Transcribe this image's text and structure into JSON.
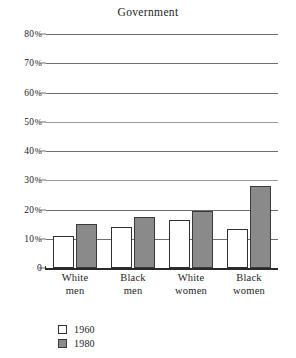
{
  "chart_data": {
    "type": "bar",
    "title": "Government",
    "xlabel": "",
    "ylabel": "",
    "ylim": [
      0,
      80
    ],
    "ytick_values": [
      80,
      70,
      60,
      50,
      40,
      30,
      20,
      10,
      0
    ],
    "ytick_labels": [
      "80%",
      "70%",
      "60%",
      "50%",
      "40%",
      "30%",
      "20%",
      "10%",
      "0"
    ],
    "grid": true,
    "legend_position": "below-left",
    "categories": [
      "White men",
      "Black men",
      "White women",
      "Black women"
    ],
    "category_lines": [
      {
        "line1": "White",
        "line2": "men"
      },
      {
        "line1": "Black",
        "line2": "men"
      },
      {
        "line1": "White",
        "line2": "women"
      },
      {
        "line1": "Black",
        "line2": "women"
      }
    ],
    "series": [
      {
        "name": "1960",
        "values": [
          11,
          14,
          16.5,
          13.5
        ],
        "color": "#ffffff",
        "edge_color": "#2f2f2f"
      },
      {
        "name": "1980",
        "values": [
          15,
          17.5,
          19.5,
          28
        ],
        "color": "#8a8a8a",
        "edge_color": "#3a3a3a"
      }
    ]
  },
  "legend": {
    "entries": [
      {
        "label": "1960",
        "swatch": "hollow-square-swatch"
      },
      {
        "label": "1980",
        "swatch": "gray-square-swatch"
      }
    ]
  },
  "colors": {
    "gridline": "#6f6f6f",
    "axis": "#2a2a2a",
    "bar_1980": "#8a8a8a",
    "bar_1960": "#ffffff",
    "text": "#1d1d1d",
    "background": "#ffffff"
  }
}
